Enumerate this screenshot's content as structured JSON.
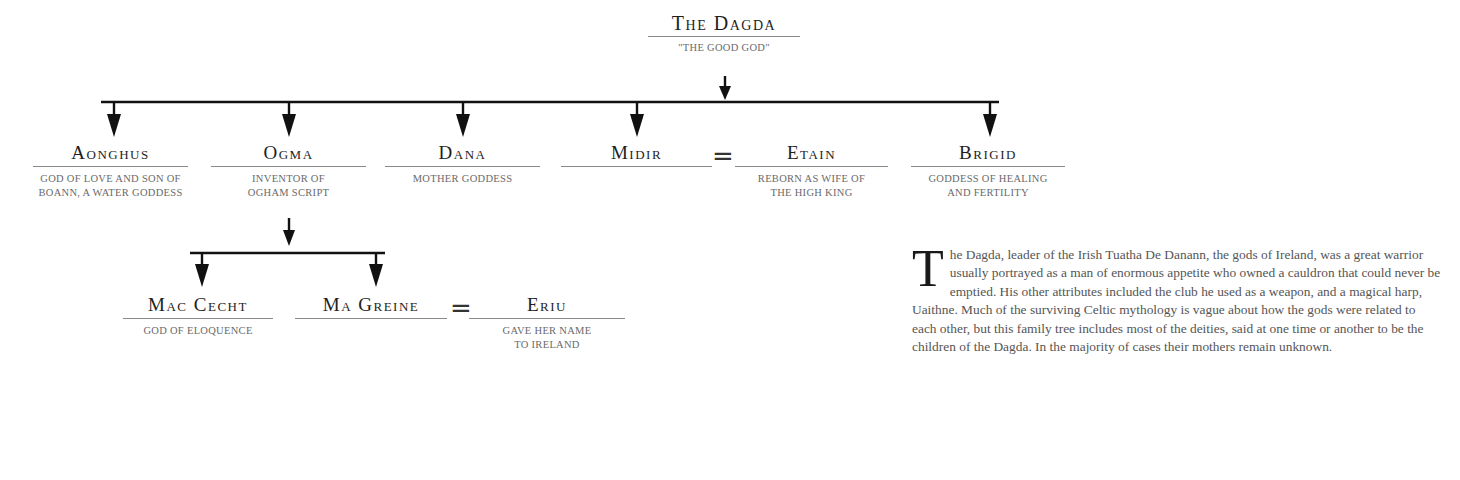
{
  "tree": {
    "root": {
      "name": "The Dagda",
      "desc": "\"The Good God\""
    },
    "children": [
      {
        "name": "Aonghus",
        "desc": "God of love and son of Boann, a water goddess"
      },
      {
        "name": "Ogma",
        "desc": "Inventor of Ogham script"
      },
      {
        "name": "Dana",
        "desc": "Mother goddess"
      },
      {
        "name": "Midir",
        "desc": ""
      },
      {
        "name": "Etain",
        "desc": "Reborn as wife of the High King"
      },
      {
        "name": "Brigid",
        "desc": "Goddess of healing and fertility"
      }
    ],
    "grandchildren": [
      {
        "name": "Mac Cecht",
        "desc": "God of eloquence"
      },
      {
        "name": "Ma Greine",
        "desc": ""
      },
      {
        "name": "Eriu",
        "desc": "Gave her name to Ireland"
      }
    ],
    "marriage_symbol": "="
  },
  "text": {
    "dropcap": "T",
    "body": "he Dagda, leader of the Irish Tuatha De Danann, the gods of Ireland, was a great warrior usually portrayed as a man of enormous appetite who owned a cauldron that could never be emptied. His other attributes included the club he used as a weapon, and a magical harp, Uaithne. Much of the surviving Celtic mythology is vague about how the gods were related to each other, but this family tree includes most of the deities, said at one time or another to be the children of the Dagda. In the majority of cases their mothers remain unknown."
  }
}
